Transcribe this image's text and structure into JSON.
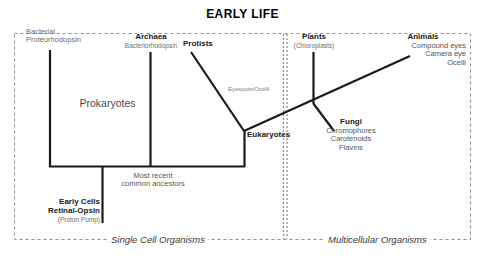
{
  "diagram": {
    "title": "EARLY LIFE",
    "nodes": {
      "bacterial": {
        "name": "Bacterial",
        "sub": "Proteorhodopsin"
      },
      "archaea": {
        "name": "Archaea",
        "sub": "Bacteriorhodopsin"
      },
      "protists": {
        "name": "Protists"
      },
      "plants": {
        "name": "Plants",
        "sub": "(Chloroplasts)"
      },
      "animals": {
        "name": "Animals",
        "trait1": "Compound eyes",
        "trait2": "Camera eye",
        "trait3": "Ocelli"
      },
      "fungi": {
        "name": "Fungi",
        "trait1": "Chromophores",
        "trait2": "Carotenoids",
        "trait3": "Flavins"
      },
      "eukaryotes": {
        "name": "Eukaryotes"
      },
      "early_cells": {
        "name1": "Early Cells",
        "name2": "Retinal-Opsin",
        "sub": "(Proton Pump)"
      }
    },
    "annotations": {
      "prokaryotes": "Prokaryotes",
      "eyespots": "Eyespots/Ocelli",
      "ancestors_line1": "Most recent",
      "ancestors_line2": "common ancestors"
    },
    "zones": {
      "single_cell": "Single Cell Organisms",
      "multicellular": "Multicellular Organisms"
    },
    "colors": {
      "line": "#1a1a1a",
      "border": "#7a7a7a",
      "divider": "#8a8a8a",
      "text_dark": "#1a1a1a",
      "text_grey": "#6e6e6e"
    }
  }
}
